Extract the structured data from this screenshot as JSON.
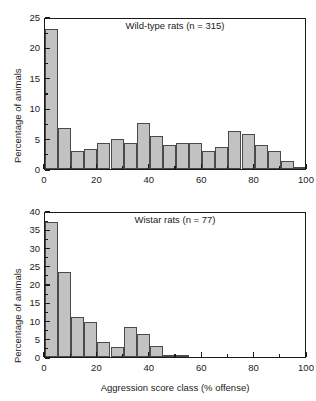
{
  "figure": {
    "background": "#ffffff",
    "bar_fill": "#c2c2c2",
    "bar_stroke": "#4a4a4a",
    "axis_color": "#1a1a1a"
  },
  "chart_data": [
    {
      "type": "bar",
      "panel": "top",
      "title": "Wild-type rats (n = 315)",
      "xlabel": "",
      "ylabel": "Percentage of animals",
      "xlim": [
        0,
        100
      ],
      "ylim": [
        0,
        25
      ],
      "xticks": [
        0,
        20,
        40,
        60,
        80,
        100
      ],
      "xticks_minor": [
        10,
        30,
        50,
        70,
        90
      ],
      "yticks": [
        0,
        5,
        10,
        15,
        20,
        25
      ],
      "yticks_minor": [
        2.5,
        7.5,
        12.5,
        17.5,
        22.5
      ],
      "grid": false,
      "legend": false,
      "bin_width": 5,
      "categories": [
        "0-5",
        "5-10",
        "10-15",
        "15-20",
        "20-25",
        "25-30",
        "30-35",
        "35-40",
        "40-45",
        "45-50",
        "50-55",
        "55-60",
        "60-65",
        "65-70",
        "70-75",
        "75-80",
        "80-85",
        "85-90",
        "90-95",
        "95-100"
      ],
      "bin_starts": [
        0,
        5,
        10,
        15,
        20,
        25,
        30,
        35,
        40,
        45,
        50,
        55,
        60,
        65,
        70,
        75,
        80,
        85,
        90,
        95
      ],
      "values": [
        23.1,
        6.7,
        3.0,
        3.3,
        4.3,
        4.9,
        4.3,
        7.6,
        5.4,
        4.0,
        4.2,
        4.3,
        3.0,
        3.7,
        6.3,
        5.7,
        4.0,
        3.0,
        1.3,
        0.3
      ]
    },
    {
      "type": "bar",
      "panel": "bottom",
      "title": "Wistar rats (n = 77)",
      "xlabel": "Aggression score class (% offense)",
      "ylabel": "Percentage of animals",
      "xlim": [
        0,
        100
      ],
      "ylim": [
        0,
        40
      ],
      "xticks": [
        0,
        20,
        40,
        60,
        80,
        100
      ],
      "xticks_minor": [
        10,
        30,
        50,
        70,
        90
      ],
      "yticks": [
        0,
        5,
        10,
        15,
        20,
        25,
        30,
        35,
        40
      ],
      "yticks_minor": [
        2.5,
        7.5,
        12.5,
        17.5,
        22.5,
        27.5,
        32.5,
        37.5
      ],
      "grid": false,
      "legend": false,
      "bin_width": 5,
      "categories": [
        "0-5",
        "5-10",
        "10-15",
        "15-20",
        "20-25",
        "25-30",
        "30-35",
        "35-40",
        "40-45",
        "45-50",
        "50-55"
      ],
      "bin_starts": [
        0,
        5,
        10,
        15,
        20,
        25,
        30,
        35,
        40,
        45,
        50
      ],
      "values": [
        37.0,
        23.3,
        11.0,
        9.6,
        4.1,
        2.8,
        8.3,
        6.4,
        2.9,
        0.3,
        0.6
      ]
    }
  ]
}
